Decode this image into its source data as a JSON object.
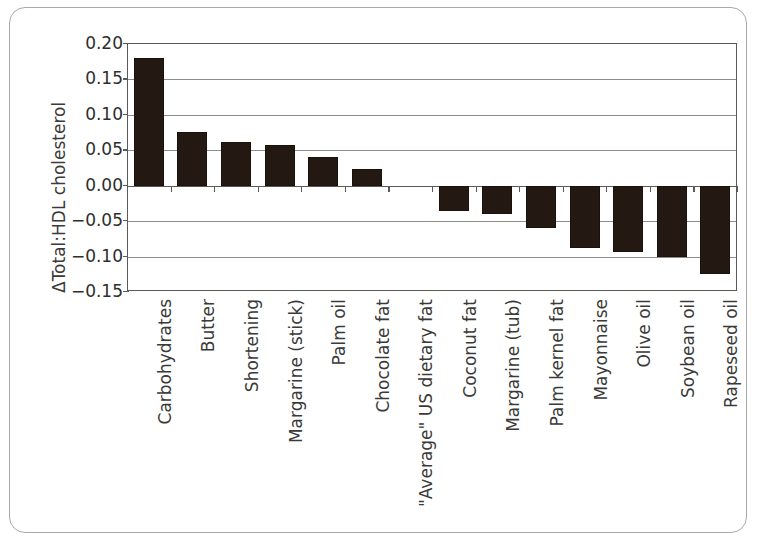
{
  "chart_data": {
    "type": "bar",
    "title": "",
    "subtitle": "",
    "xlabel": "",
    "ylabel": "ΔTotal:HDL cholesterol",
    "ylim": [
      -0.15,
      0.2
    ],
    "ytick_values": [
      0.2,
      0.15,
      0.1,
      0.05,
      0.0,
      -0.05,
      -0.1,
      -0.15
    ],
    "ytick_labels": [
      "0.20",
      "0.15",
      "0.10",
      "0.05",
      "0.00",
      "−0.05",
      "−0.10",
      "−0.15"
    ],
    "grid": true,
    "legend": "none",
    "bar_color": "#241812",
    "categories": [
      "Carbohydrates",
      "Butter",
      "Shortening",
      "Margarine (stick)",
      "Palm oil",
      "Chocolate fat",
      "\"Average\" US dietary fat",
      "Coconut fat",
      "Margarine (tub)",
      "Palm kernel fat",
      "Mayonnaise",
      "Olive oil",
      "Soybean oil",
      "Rapeseed oil"
    ],
    "values": [
      0.18,
      0.076,
      0.062,
      0.058,
      0.041,
      0.024,
      0.0,
      -0.036,
      -0.04,
      -0.06,
      -0.088,
      -0.094,
      -0.101,
      -0.125
    ]
  },
  "figure": {
    "border_color": "#a9a9a6",
    "background": "#ffffff",
    "axis_color": "#5a5a57",
    "grid_color": "#8d8d89"
  }
}
